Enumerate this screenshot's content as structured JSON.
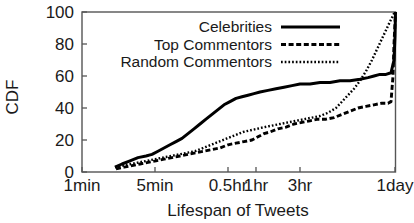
{
  "chart_data": {
    "type": "line",
    "title": "",
    "xlabel": "Lifespan of Tweets",
    "ylabel": "CDF",
    "ylim": [
      0,
      100
    ],
    "yticks": [
      0,
      20,
      40,
      60,
      80,
      100
    ],
    "ytick_labels": [
      "0",
      "20",
      "40",
      "60",
      "80",
      "100"
    ],
    "xtick_labels": [
      "1min",
      "5min",
      "0.5hr",
      "1hr",
      "3hr",
      "1day"
    ],
    "xtick_positions_px": [
      82,
      155,
      228,
      256,
      300,
      395
    ],
    "x_axis_scale": "log-time",
    "grid": false,
    "legend_position": "top-center",
    "series": [
      {
        "name": "Celebrities",
        "style": "solid",
        "color": "#000000",
        "points": [
          [
            115,
            3
          ],
          [
            122,
            5
          ],
          [
            130,
            7
          ],
          [
            138,
            9
          ],
          [
            146,
            10
          ],
          [
            152,
            11
          ],
          [
            158,
            13
          ],
          [
            164,
            15
          ],
          [
            170,
            17
          ],
          [
            176,
            19
          ],
          [
            182,
            21
          ],
          [
            188,
            24
          ],
          [
            194,
            27
          ],
          [
            200,
            30
          ],
          [
            206,
            33
          ],
          [
            212,
            36
          ],
          [
            218,
            39
          ],
          [
            224,
            42
          ],
          [
            230,
            44
          ],
          [
            236,
            46
          ],
          [
            242,
            47
          ],
          [
            248,
            48
          ],
          [
            254,
            49
          ],
          [
            260,
            50
          ],
          [
            268,
            51
          ],
          [
            276,
            52
          ],
          [
            284,
            53
          ],
          [
            292,
            54
          ],
          [
            300,
            55
          ],
          [
            310,
            55
          ],
          [
            320,
            56
          ],
          [
            330,
            56
          ],
          [
            340,
            57
          ],
          [
            350,
            57
          ],
          [
            360,
            58
          ],
          [
            368,
            59
          ],
          [
            374,
            60
          ],
          [
            380,
            61
          ],
          [
            386,
            61
          ],
          [
            391,
            62
          ],
          [
            394,
            70
          ],
          [
            395,
            85
          ],
          [
            395.5,
            100
          ]
        ]
      },
      {
        "name": "Top Commentors",
        "style": "dashed",
        "color": "#000000",
        "points": [
          [
            116,
            2
          ],
          [
            124,
            3
          ],
          [
            132,
            4
          ],
          [
            140,
            5
          ],
          [
            148,
            6
          ],
          [
            156,
            7
          ],
          [
            164,
            8
          ],
          [
            172,
            9
          ],
          [
            180,
            10
          ],
          [
            188,
            11
          ],
          [
            196,
            12
          ],
          [
            204,
            13
          ],
          [
            212,
            14
          ],
          [
            220,
            15
          ],
          [
            228,
            17
          ],
          [
            236,
            18
          ],
          [
            244,
            19
          ],
          [
            252,
            20
          ],
          [
            258,
            22
          ],
          [
            264,
            24
          ],
          [
            270,
            25
          ],
          [
            278,
            27
          ],
          [
            286,
            28
          ],
          [
            294,
            30
          ],
          [
            302,
            31
          ],
          [
            310,
            32
          ],
          [
            318,
            33
          ],
          [
            326,
            33
          ],
          [
            334,
            34
          ],
          [
            342,
            36
          ],
          [
            350,
            38
          ],
          [
            358,
            40
          ],
          [
            366,
            41
          ],
          [
            374,
            42
          ],
          [
            382,
            43
          ],
          [
            388,
            43
          ],
          [
            391,
            44
          ],
          [
            393,
            60
          ],
          [
            394,
            80
          ],
          [
            395.5,
            100
          ]
        ]
      },
      {
        "name": "Random Commentors",
        "style": "dotted",
        "color": "#000000",
        "points": [
          [
            115,
            3
          ],
          [
            123,
            4
          ],
          [
            131,
            5
          ],
          [
            139,
            6
          ],
          [
            147,
            7
          ],
          [
            155,
            8
          ],
          [
            163,
            9
          ],
          [
            171,
            10
          ],
          [
            179,
            11
          ],
          [
            187,
            12
          ],
          [
            195,
            13
          ],
          [
            203,
            15
          ],
          [
            211,
            17
          ],
          [
            219,
            19
          ],
          [
            227,
            21
          ],
          [
            235,
            23
          ],
          [
            243,
            25
          ],
          [
            250,
            26
          ],
          [
            257,
            27
          ],
          [
            264,
            28
          ],
          [
            272,
            29
          ],
          [
            280,
            30
          ],
          [
            288,
            31
          ],
          [
            296,
            32
          ],
          [
            304,
            33
          ],
          [
            312,
            34
          ],
          [
            320,
            35
          ],
          [
            328,
            37
          ],
          [
            336,
            40
          ],
          [
            342,
            44
          ],
          [
            348,
            48
          ],
          [
            354,
            52
          ],
          [
            360,
            57
          ],
          [
            366,
            63
          ],
          [
            372,
            70
          ],
          [
            378,
            78
          ],
          [
            384,
            86
          ],
          [
            390,
            94
          ],
          [
            394,
            99
          ],
          [
            395.5,
            100
          ]
        ]
      }
    ]
  },
  "axes": {
    "y_label": "CDF",
    "x_label": "Lifespan of Tweets",
    "y_ticks": [
      {
        "label": "100",
        "value": 100
      },
      {
        "label": "80",
        "value": 80
      },
      {
        "label": "60",
        "value": 60
      },
      {
        "label": "40",
        "value": 40
      },
      {
        "label": "20",
        "value": 20
      },
      {
        "label": "0",
        "value": 0
      }
    ],
    "x_ticks": [
      {
        "label": "1min",
        "x": 82
      },
      {
        "label": "5min",
        "x": 155
      },
      {
        "label": "0.5hr",
        "x": 228
      },
      {
        "label": "1hr",
        "x": 256
      },
      {
        "label": "3hr",
        "x": 300
      },
      {
        "label": "1day",
        "x": 395
      }
    ]
  },
  "legend": {
    "entries": [
      {
        "label": "Celebrities",
        "style": "solid"
      },
      {
        "label": "Top Commentors",
        "style": "dashed"
      },
      {
        "label": "Random Commentors",
        "style": "dotted"
      }
    ]
  },
  "colors": {
    "line": "#000000",
    "frame": "#555555",
    "text": "#1a1a1a",
    "background": "#ffffff"
  }
}
